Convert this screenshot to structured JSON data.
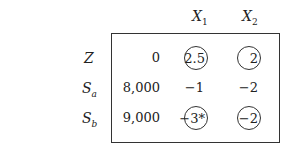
{
  "tableau": {
    "columns": [
      {
        "var": "X",
        "sub": "1"
      },
      {
        "var": "X",
        "sub": "2"
      }
    ],
    "rows": [
      {
        "label": "Z",
        "sub": "",
        "rhs": "0",
        "values": [
          "2.5",
          "2"
        ],
        "circled": [
          true,
          true
        ]
      },
      {
        "label": "S",
        "sub": "a",
        "rhs": "8,000",
        "values": [
          "−1",
          "−2"
        ],
        "circled": [
          false,
          false
        ]
      },
      {
        "label": "S",
        "sub": "b",
        "rhs": "9,000",
        "values": [
          "−3*",
          "−2"
        ],
        "circled": [
          true,
          true
        ]
      }
    ]
  }
}
